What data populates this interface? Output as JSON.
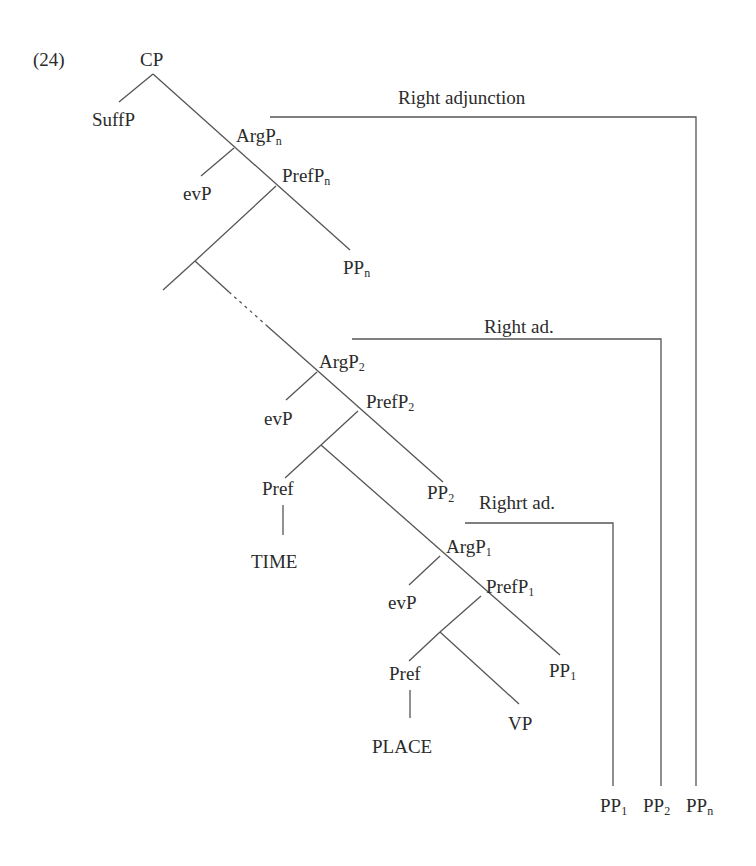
{
  "example_number": "(24)",
  "nodes": {
    "cp": "CP",
    "suffp": "SuffP",
    "argp_n": {
      "base": "ArgP",
      "sub": "n"
    },
    "evp_n": "evP",
    "prefp_n": {
      "base": "PrefP",
      "sub": "n"
    },
    "pp_n": {
      "base": "PP",
      "sub": "n"
    },
    "argp_2": {
      "base": "ArgP",
      "sub": "2"
    },
    "evp_2": "evP",
    "prefp_2": {
      "base": "PrefP",
      "sub": "2"
    },
    "pref_2": "Pref",
    "time": "TIME",
    "pp_2": {
      "base": "PP",
      "sub": "2"
    },
    "argp_1": {
      "base": "ArgP",
      "sub": "1"
    },
    "evp_1": "evP",
    "prefp_1": {
      "base": "PrefP",
      "sub": "1"
    },
    "pref_1": "Pref",
    "place": "PLACE",
    "vp": "VP",
    "pp_1": {
      "base": "PP",
      "sub": "1"
    }
  },
  "adjunction_labels": {
    "outer": "Right adjunction",
    "middle": "Right ad.",
    "inner": "Righrt ad."
  },
  "adjoined": [
    {
      "base": "PP",
      "sub": "1"
    },
    {
      "base": "PP",
      "sub": "2"
    },
    {
      "base": "PP",
      "sub": "n"
    }
  ]
}
